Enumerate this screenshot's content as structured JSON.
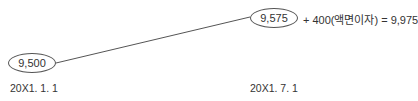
{
  "diagram": {
    "nodes": [
      {
        "id": "start",
        "value": "9,500",
        "date": "20X1. 1. 1"
      },
      {
        "id": "end",
        "value": "9,575",
        "date": "20X1. 7. 1"
      }
    ],
    "annotation": "+ 400(액면이자) = 9,975"
  }
}
